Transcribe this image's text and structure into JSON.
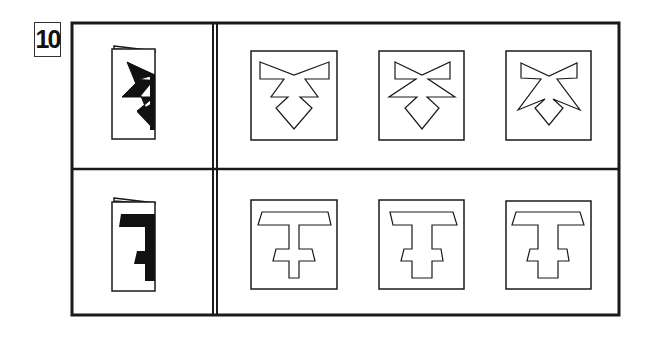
{
  "puzzle": {
    "number": "10",
    "type": "paper-folding-cutout",
    "rows": [
      {
        "id": "row-1",
        "folded_paper": "folded sheet with black zigzag notches cut along fold edge",
        "options": [
          "bow-shape-a",
          "bow-shape-b",
          "bow-shape-c"
        ]
      },
      {
        "id": "row-2",
        "folded_paper": "folded sheet with black T-shaped cut along fold edge",
        "options": [
          "t-shape-a",
          "t-shape-b",
          "t-shape-c"
        ]
      }
    ]
  },
  "colors": {
    "ink": "#1a1a1a",
    "background": "#ffffff"
  }
}
